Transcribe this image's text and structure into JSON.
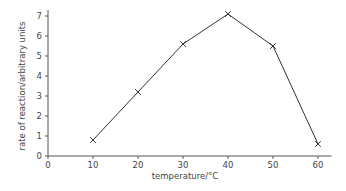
{
  "chart_data": {
    "type": "line",
    "title": "",
    "xlabel": "temperature/°C",
    "ylabel": "rate of reaction/arbitrary units",
    "x": [
      10,
      20,
      30,
      40,
      50,
      60
    ],
    "series": [
      {
        "name": "rate of reaction",
        "values": [
          0.8,
          3.2,
          5.6,
          7.1,
          5.5,
          0.6
        ],
        "marker": "x"
      }
    ],
    "xlim": [
      0,
      63
    ],
    "ylim": [
      0,
      7.3
    ],
    "xticks": [
      0,
      10,
      20,
      30,
      40,
      50,
      60
    ],
    "yticks": [
      0,
      1,
      2,
      3,
      4,
      5,
      6,
      7
    ],
    "grid": false,
    "legend": "none",
    "colors": {
      "line": "#333333",
      "axis": "#555555",
      "text": "#444444"
    }
  }
}
